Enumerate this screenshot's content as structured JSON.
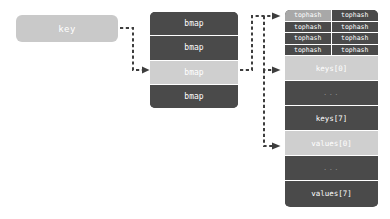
{
  "diagram": {
    "colors": {
      "dark_cell": "#4a4a4a",
      "highlight_cell": "#cfcfcf",
      "tophash_highlight": "#a8a8a8",
      "key_box": "#c9c9c9",
      "arrow": "#3d3d3d",
      "text_light": "#ffffff",
      "background": "#ffffff"
    },
    "key_box": {
      "label": "key"
    },
    "bmap_column": {
      "cells": [
        {
          "label": "bmap",
          "highlighted": false
        },
        {
          "label": "bmap",
          "highlighted": false
        },
        {
          "label": "bmap",
          "highlighted": true
        },
        {
          "label": "bmap",
          "highlighted": false
        }
      ]
    },
    "bucket": {
      "tophash_rows": [
        [
          {
            "label": "tophash",
            "highlighted": true
          },
          {
            "label": "tophash",
            "highlighted": false
          }
        ],
        [
          {
            "label": "tophash",
            "highlighted": false
          },
          {
            "label": "tophash",
            "highlighted": false
          }
        ],
        [
          {
            "label": "tophash",
            "highlighted": false
          },
          {
            "label": "tophash",
            "highlighted": false
          }
        ],
        [
          {
            "label": "tophash",
            "highlighted": false
          },
          {
            "label": "tophash",
            "highlighted": false
          }
        ]
      ],
      "slots": [
        {
          "label": "keys[0]",
          "highlighted": true,
          "ellipsis": false
        },
        {
          "label": "...",
          "highlighted": false,
          "ellipsis": true
        },
        {
          "label": "keys[7]",
          "highlighted": false,
          "ellipsis": false
        },
        {
          "label": "values[0]",
          "highlighted": true,
          "ellipsis": false
        },
        {
          "label": "...",
          "highlighted": false,
          "ellipsis": true
        },
        {
          "label": "values[7]",
          "highlighted": false,
          "ellipsis": false
        }
      ]
    },
    "arrows": [
      {
        "name": "key-to-bmap",
        "from": "key",
        "to": "bmap[2]"
      },
      {
        "name": "bmap-to-tophash",
        "from": "bmap[2]",
        "to": "tophash[0][0]"
      },
      {
        "name": "bmap-to-keys0",
        "from": "bmap[2]",
        "to": "keys[0]"
      },
      {
        "name": "bmap-to-values0",
        "from": "bmap[2]",
        "to": "values[0]"
      }
    ]
  }
}
